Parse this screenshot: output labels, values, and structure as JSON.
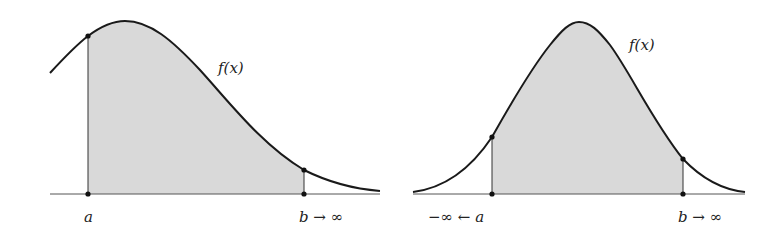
{
  "figures": [
    {
      "id": "left",
      "description": "Skewed density f(x) with shaded area between a and b, b tends to infinity",
      "function_label": "f(x)",
      "lower_label": "a",
      "upper_label": "b → ∞"
    },
    {
      "id": "right",
      "description": "Symmetric bell-shaped density f(x) with shaded area between a and b, a tends to -infinity and b tends to infinity",
      "function_label": "f(x)",
      "lower_label": "−∞ ← a",
      "upper_label": "b → ∞"
    }
  ],
  "colors": {
    "curve": "#1a1a1a",
    "shade": "#d9d9d9",
    "axis": "#555555"
  }
}
